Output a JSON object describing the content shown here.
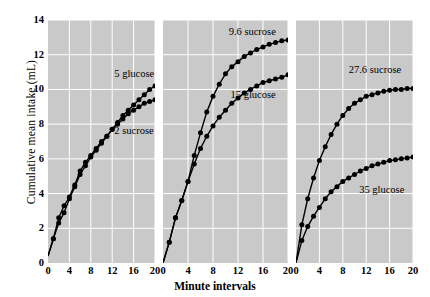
{
  "chart_data": {
    "type": "line",
    "title": "",
    "xlabel": "Minute intervals",
    "ylabel": "Cumulative mean intake (mL)",
    "xlim": [
      0,
      20
    ],
    "ylim": [
      0,
      14
    ],
    "xticks": [
      0,
      4,
      8,
      12,
      16,
      20
    ],
    "yticks": [
      0,
      2,
      4,
      6,
      8,
      10,
      12,
      14
    ],
    "grid": true,
    "legend_position": "inline-annotations",
    "panel_background": "#c9c9c9",
    "line_color": "#000000",
    "marker": "filled-circle",
    "panels": [
      {
        "index": 1,
        "series": [
          {
            "name": "5 glucose",
            "label": "5 glucose",
            "x": [
              0,
              1,
              2,
              3,
              4,
              5,
              6,
              7,
              8,
              9,
              10,
              11,
              12,
              13,
              14,
              15,
              16,
              17,
              18,
              19,
              20
            ],
            "values": [
              0.4,
              1.4,
              2.3,
              2.9,
              3.7,
              4.4,
              5.1,
              5.6,
              6.1,
              6.5,
              6.9,
              7.3,
              7.7,
              8.1,
              8.5,
              8.8,
              9.1,
              9.4,
              9.7,
              10.0,
              10.2
            ]
          },
          {
            "name": "2 sucrose",
            "label": "2 sucrose",
            "x": [
              0,
              1,
              2,
              3,
              4,
              5,
              6,
              7,
              8,
              9,
              10,
              11,
              12,
              13,
              14,
              15,
              16,
              17,
              18,
              19,
              20
            ],
            "values": [
              0.4,
              1.4,
              2.6,
              3.3,
              3.8,
              4.5,
              5.3,
              5.8,
              6.2,
              6.6,
              7.0,
              7.3,
              7.7,
              8.0,
              8.3,
              8.6,
              8.8,
              9.0,
              9.2,
              9.3,
              9.4
            ]
          }
        ],
        "annotations": [
          {
            "text": "5 glucose",
            "x": 12.4,
            "y": 10.9
          },
          {
            "text": "2 sucrose",
            "x": 12.4,
            "y": 7.6
          }
        ]
      },
      {
        "index": 2,
        "series": [
          {
            "name": "9.6 sucrose",
            "label": "9.6 sucrose",
            "x": [
              0,
              1,
              2,
              3,
              4,
              5,
              6,
              7,
              8,
              9,
              10,
              11,
              12,
              13,
              14,
              15,
              16,
              17,
              18,
              19,
              20
            ],
            "values": [
              0.0,
              1.2,
              2.6,
              3.6,
              4.7,
              6.2,
              7.5,
              8.7,
              9.6,
              10.3,
              10.9,
              11.3,
              11.6,
              11.9,
              12.1,
              12.3,
              12.45,
              12.6,
              12.7,
              12.8,
              12.85
            ]
          },
          {
            "name": "15 glucose",
            "label": "15 glucose",
            "x": [
              0,
              1,
              2,
              3,
              4,
              5,
              6,
              7,
              8,
              9,
              10,
              11,
              12,
              13,
              14,
              15,
              16,
              17,
              18,
              19,
              20
            ],
            "values": [
              0.0,
              1.2,
              2.6,
              3.6,
              4.7,
              5.7,
              6.6,
              7.3,
              7.9,
              8.4,
              8.8,
              9.2,
              9.5,
              9.8,
              10.0,
              10.2,
              10.4,
              10.5,
              10.6,
              10.7,
              10.85
            ]
          }
        ],
        "annotations": [
          {
            "text": "9.6 sucrose",
            "x": 10.5,
            "y": 13.3
          },
          {
            "text": "15 glucose",
            "x": 10.8,
            "y": 9.7
          }
        ]
      },
      {
        "index": 3,
        "series": [
          {
            "name": "27.6 sucrose",
            "label": "27.6 sucrose",
            "x": [
              0,
              1,
              2,
              3,
              4,
              5,
              6,
              7,
              8,
              9,
              10,
              11,
              12,
              13,
              14,
              15,
              16,
              17,
              18,
              19,
              20
            ],
            "values": [
              0.0,
              2.2,
              3.7,
              4.9,
              5.9,
              6.7,
              7.4,
              8.0,
              8.5,
              8.9,
              9.2,
              9.4,
              9.6,
              9.7,
              9.8,
              9.9,
              9.95,
              10.0,
              10.0,
              10.05,
              10.05
            ]
          },
          {
            "name": "35 glucose",
            "label": "35 glucose",
            "x": [
              0,
              1,
              2,
              3,
              4,
              5,
              6,
              7,
              8,
              9,
              10,
              11,
              12,
              13,
              14,
              15,
              16,
              17,
              18,
              19,
              20
            ],
            "values": [
              0.0,
              1.3,
              2.1,
              2.7,
              3.2,
              3.7,
              4.1,
              4.4,
              4.7,
              4.9,
              5.1,
              5.3,
              5.45,
              5.6,
              5.7,
              5.8,
              5.9,
              5.95,
              6.0,
              6.05,
              6.1
            ]
          }
        ],
        "annotations": [
          {
            "text": "27.6 sucrose",
            "x": 9.0,
            "y": 11.1
          },
          {
            "text": "35 glucose",
            "x": 10.8,
            "y": 4.2
          }
        ]
      }
    ]
  }
}
